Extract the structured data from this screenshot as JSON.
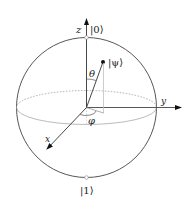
{
  "diagram": {
    "colors": {
      "line": "#333333",
      "dotted": "#999999",
      "projection": "#bbbbbb",
      "background": "#ffffff"
    },
    "labels": {
      "z_axis": "z",
      "y_axis": "y",
      "x_axis": "x",
      "ket_zero": "|0⟩",
      "ket_one": "|1⟩",
      "ket_psi": "|ψ⟩",
      "theta": "θ",
      "phi": "φ"
    }
  }
}
